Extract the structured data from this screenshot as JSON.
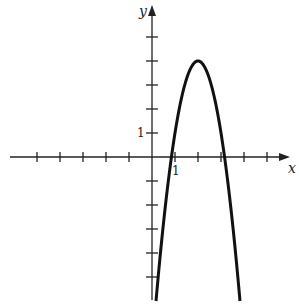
{
  "chart_data": {
    "type": "line",
    "title": "",
    "xlabel": "x",
    "ylabel": "y",
    "function": "y = -3(x-2)^2 + 4",
    "vertex": [
      2,
      4
    ],
    "x_intercepts": [
      0.845,
      3.155
    ],
    "x": [
      0.13,
      0.5,
      0.845,
      1,
      1.5,
      2,
      2.5,
      3,
      3.155,
      3.5,
      3.87
    ],
    "series": [
      {
        "name": "parabola",
        "values": [
          -6.49,
          -2.75,
          0,
          1,
          3.25,
          4,
          3.25,
          1,
          0,
          -2.75,
          -6.49
        ]
      }
    ],
    "xlim": [
      -5.2,
      6.2
    ],
    "ylim": [
      -6,
      6.2
    ],
    "x_ticks": [
      -5,
      -4,
      -3,
      -2,
      -1,
      1,
      2,
      3,
      4,
      5
    ],
    "y_ticks": [
      -5,
      -4,
      -3,
      -2,
      -1,
      1,
      2,
      3,
      4,
      5
    ],
    "tick_labels": {
      "x": "1",
      "y": "1"
    },
    "grid": false,
    "legend": null
  }
}
